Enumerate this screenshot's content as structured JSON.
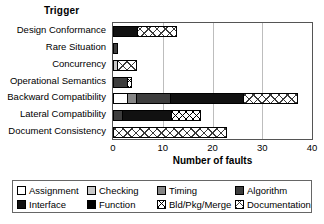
{
  "chart_data": {
    "type": "bar",
    "orientation": "horizontal",
    "stacked": true,
    "title": "Trigger",
    "xlabel": "Number of faults",
    "ylabel": "",
    "xlim": [
      0,
      40
    ],
    "xticks": [
      0,
      10,
      20,
      30,
      40
    ],
    "grid": true,
    "legend_position": "bottom",
    "categories": [
      "Design Conformance",
      "Rare Situation",
      "Concurrency",
      "Operational Semantics",
      "Backward Compatibility",
      "Lateral Compatibility",
      "Document Consistency"
    ],
    "series": [
      {
        "name": "Assignment",
        "fill": "f-assignment",
        "values": [
          0,
          0,
          0,
          0,
          3,
          0,
          0
        ]
      },
      {
        "name": "Checking",
        "fill": "f-checking",
        "values": [
          0,
          0,
          1,
          0,
          0,
          0,
          0
        ]
      },
      {
        "name": "Timing",
        "fill": "f-timing",
        "values": [
          0,
          0,
          0,
          0,
          2,
          0,
          0
        ]
      },
      {
        "name": "Algorithm",
        "fill": "f-algorithm",
        "values": [
          0,
          1,
          0,
          3,
          7,
          2,
          0
        ]
      },
      {
        "name": "Interface",
        "fill": "f-interface",
        "values": [
          5,
          0,
          0,
          0,
          15,
          10,
          0
        ]
      },
      {
        "name": "Function",
        "fill": "f-function",
        "values": [
          0,
          0,
          0,
          0,
          0,
          0,
          0
        ]
      },
      {
        "name": "Bld/Pkg/Merge",
        "fill": "f-bldpkg",
        "values": [
          0,
          0,
          0,
          1,
          0,
          6,
          0
        ]
      },
      {
        "name": "Documentation",
        "fill": "f-doc",
        "values": [
          8,
          0,
          4,
          0,
          11,
          0,
          23
        ]
      }
    ],
    "totals": [
      13,
      1,
      5,
      4,
      38,
      18,
      23
    ]
  },
  "legend": {
    "items": [
      {
        "label": "Assignment",
        "fill": "f-assignment"
      },
      {
        "label": "Checking",
        "fill": "f-checking"
      },
      {
        "label": "Timing",
        "fill": "f-timing"
      },
      {
        "label": "Algorithm",
        "fill": "f-algorithm"
      },
      {
        "label": "Interface",
        "fill": "f-interface"
      },
      {
        "label": "Function",
        "fill": "f-function"
      },
      {
        "label": "Bld/Pkg/Merge",
        "fill": "f-bldpkg"
      },
      {
        "label": "Documentation",
        "fill": "f-doc"
      }
    ]
  },
  "colors": {
    "assignment": "#ffffff",
    "checking": "#c9c9c9",
    "timing": "#868686",
    "algorithm": "#3d3d3d",
    "interface": "#111111",
    "function": "#000000",
    "frame": "#555555",
    "grid": "#bdbdbd"
  }
}
